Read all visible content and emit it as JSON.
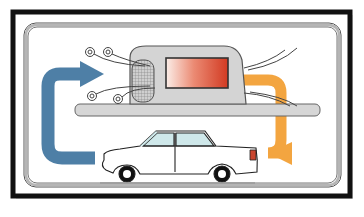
{
  "diagram": {
    "colors": {
      "frame": "#111111",
      "inner_border": "#8a8a8a",
      "background": "#ffffff",
      "unit_body": "#d4d4d4",
      "unit_outline": "#555555",
      "heater_panel_start": "#fbeee8",
      "heater_panel_end": "#d8412a",
      "arrow_intake": "#4e7fa6",
      "arrow_output": "#f3a540",
      "car_body": "#ffffff",
      "car_glass": "#cfe8ea",
      "tail_light": "#c9452e",
      "road": "#9a9a9a"
    },
    "elements": [
      {
        "name": "intake-arrow",
        "color_key": "arrow_intake"
      },
      {
        "name": "hvac-unit"
      },
      {
        "name": "heater-core"
      },
      {
        "name": "output-arrow",
        "color_key": "arrow_output"
      },
      {
        "name": "car"
      }
    ]
  }
}
